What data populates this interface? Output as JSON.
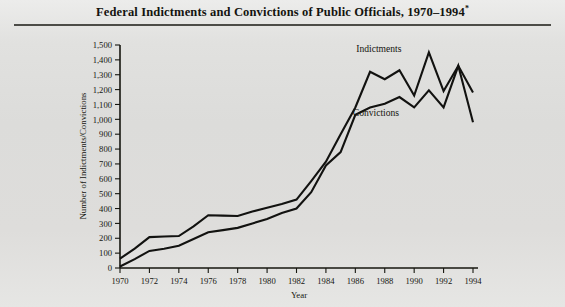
{
  "figure": {
    "title_main": "Federal Indictments and Convictions of Public Officials, 1970–1994",
    "title_footnote_marker": "*",
    "background_color": "#dcdcda",
    "ink_color": "#121210"
  },
  "chart_data": {
    "type": "line",
    "title": "Federal Indictments and Convictions of Public Officials, 1970–1994*",
    "xlabel": "Year",
    "ylabel": "Number of Indictments/Convictions",
    "grid": false,
    "legend_position": "inline-annotation",
    "xlim": [
      1970,
      1994
    ],
    "ylim": [
      0,
      1500
    ],
    "ytick_step": 100,
    "xtick_step": 2,
    "x": [
      1970,
      1971,
      1972,
      1973,
      1974,
      1975,
      1976,
      1977,
      1978,
      1979,
      1980,
      1981,
      1982,
      1983,
      1984,
      1985,
      1986,
      1987,
      1988,
      1989,
      1990,
      1991,
      1992,
      1993,
      1994
    ],
    "xticklabels": [
      "1970",
      "1972",
      "1974",
      "1976",
      "1978",
      "1980",
      "1982",
      "1984",
      "1986",
      "1988",
      "1990",
      "1992",
      "1994"
    ],
    "yticklabels": [
      "0",
      "100",
      "200",
      "300",
      "400",
      "500",
      "600",
      "700",
      "800",
      "900",
      "1,000",
      "1,100",
      "1,200",
      "1,300",
      "1,400",
      "1,500"
    ],
    "series": [
      {
        "name": "Indictments",
        "color": "#121210",
        "values": [
          63,
          130,
          208,
          212,
          215,
          280,
          355,
          352,
          350,
          380,
          405,
          430,
          460,
          585,
          715,
          900,
          1080,
          1320,
          1270,
          1330,
          1160,
          1450,
          1190,
          1360,
          1180
        ],
        "label_x": 1988,
        "label_y": 1445
      },
      {
        "name": "Convictions",
        "color": "#121210",
        "values": [
          10,
          60,
          115,
          130,
          150,
          195,
          240,
          255,
          270,
          300,
          330,
          370,
          400,
          510,
          690,
          780,
          1030,
          1080,
          1105,
          1150,
          1080,
          1195,
          1080,
          1360,
          980
        ]
      }
    ],
    "annotations": [
      {
        "text": "Indictments",
        "x": 1987.6,
        "y": 1450
      },
      {
        "text": "Convictions",
        "x": 1987.4,
        "y": 1020
      }
    ]
  }
}
